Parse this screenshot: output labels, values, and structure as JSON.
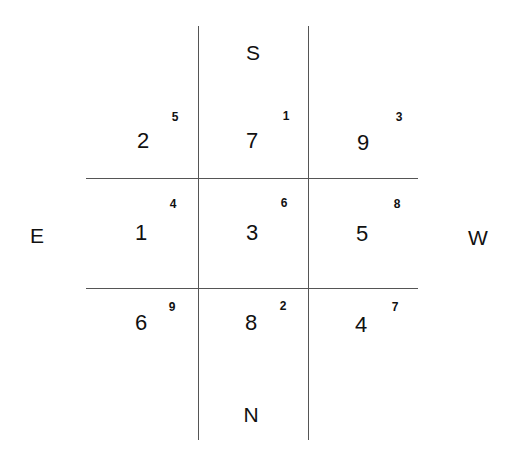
{
  "directions": {
    "top": "S",
    "bottom": "N",
    "left": "E",
    "right": "W"
  },
  "grid": {
    "rows": [
      [
        {
          "main": "2",
          "sup": "5"
        },
        {
          "main": "7",
          "sup": "1"
        },
        {
          "main": "9",
          "sup": "3"
        }
      ],
      [
        {
          "main": "1",
          "sup": "4"
        },
        {
          "main": "3",
          "sup": "6"
        },
        {
          "main": "5",
          "sup": "8"
        }
      ],
      [
        {
          "main": "6",
          "sup": "9"
        },
        {
          "main": "8",
          "sup": "2"
        },
        {
          "main": "4",
          "sup": "7"
        }
      ]
    ]
  },
  "colors": {
    "line": "#555555",
    "text": "#111111",
    "background": "#ffffff"
  }
}
